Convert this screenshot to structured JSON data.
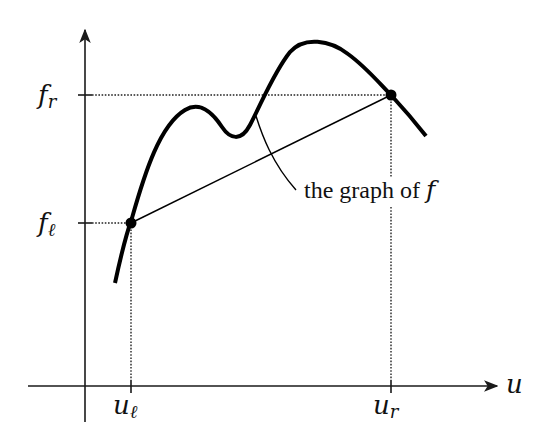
{
  "diagram": {
    "axes": {
      "x_label": "u",
      "x_ticks": [
        {
          "id": "u_l",
          "base": "u",
          "sub": "ℓ"
        },
        {
          "id": "u_r",
          "base": "u",
          "sub": "r"
        }
      ],
      "y_ticks": [
        {
          "id": "f_r",
          "base": "f",
          "sub": "r"
        },
        {
          "id": "f_l",
          "base": "f",
          "sub": "ℓ"
        }
      ]
    },
    "annotation": {
      "text": "the graph of ",
      "symbol": "f"
    },
    "points": [
      {
        "name": "(u_ℓ, f_ℓ)"
      },
      {
        "name": "(u_r, f_r)"
      }
    ],
    "colors": {
      "ink": "#000000",
      "background": "#ffffff"
    }
  }
}
